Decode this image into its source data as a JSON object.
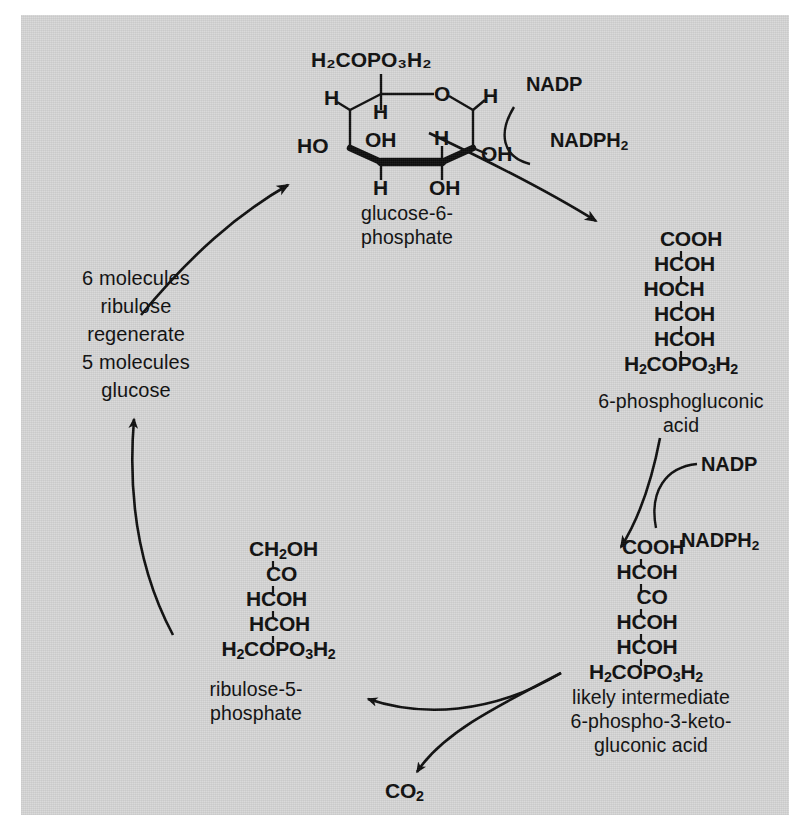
{
  "figure": {
    "background_color": "#d7d7d7",
    "ink_color": "#0d0d0d"
  },
  "molecules": {
    "glucose6phosphate": {
      "caption_line1": "glucose-6-",
      "caption_line2": "phosphate",
      "ring_labels": {
        "top_phosphate": "H₂COPO₃H₂",
        "ring_oxygen": "O",
        "c5_h_left": "H",
        "c1_h_right": "H",
        "c2_oh_right": "OH",
        "c3_oh_bottom": "OH",
        "c4_h_bottom": "H",
        "c4_ho_left": "HO",
        "c3_h_upper": "H",
        "c2_h_upper": "H",
        "c5_oh_inner": "OH"
      }
    },
    "phosphogluconic_acid": {
      "rows": [
        "COOH",
        "HCOH",
        "HOCH",
        "HCOH",
        "HCOH",
        "H₂COPO₃H₂"
      ],
      "caption_line1": "6-phosphogluconic",
      "caption_line2": "acid"
    },
    "keto_gluconic_acid": {
      "rows": [
        "COOH",
        "HCOH",
        "CO",
        "HCOH",
        "HCOH",
        "H₂COPO₃H₂"
      ],
      "caption_line1": "likely intermediate",
      "caption_line2": "6-phospho-3-keto-",
      "caption_line3": "gluconic acid"
    },
    "ribulose5phosphate": {
      "rows": [
        "CH₂OH",
        "CO",
        "HCOH",
        "HCOH",
        "H₂COPO₃H₂"
      ],
      "caption_line1": "ribulose-5-",
      "caption_line2": "phosphate"
    },
    "carbon_dioxide": {
      "label": "CO₂"
    }
  },
  "cofactors": {
    "first_pair": {
      "substrate": "NADP",
      "product": "NADPH₂"
    },
    "second_pair": {
      "substrate": "NADP",
      "product": "NADPH₂"
    }
  },
  "regeneration_note": {
    "line1": "6 molecules",
    "line2": "ribulose",
    "line3": "regenerate",
    "line4": "5 molecules",
    "line5": "glucose"
  }
}
